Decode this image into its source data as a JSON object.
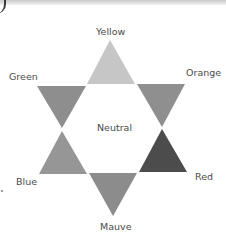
{
  "diagram": {
    "type": "hexagram-color-star",
    "center_label": "Neutral",
    "triangles": [
      {
        "name": "Yellow",
        "direction": "up",
        "fill": "#c6c6c6",
        "points": "110,40 87,84 135,84"
      },
      {
        "name": "Orange",
        "direction": "down",
        "fill": "#8f8f8f",
        "points": "137,84 185,84 162,127"
      },
      {
        "name": "Red",
        "direction": "up",
        "fill": "#4c4c4c",
        "points": "162,129 139,172 187,172"
      },
      {
        "name": "Mauve",
        "direction": "down",
        "fill": "#8c8c8c",
        "points": "89,173 137,173 113,216"
      },
      {
        "name": "Blue",
        "direction": "up",
        "fill": "#969696",
        "points": "62,131 39,174 87,174"
      },
      {
        "name": "Green",
        "direction": "down",
        "fill": "#8e8e8e",
        "points": "37,86 86,86 62,128"
      }
    ],
    "labels": {
      "yellow": "Yellow",
      "orange": "Orange",
      "red": "Red",
      "mauve": "Mauve",
      "blue": "Blue",
      "green": "Green",
      "neutral": "Neutral"
    }
  }
}
